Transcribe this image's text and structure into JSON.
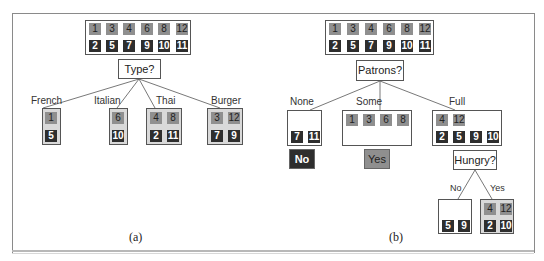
{
  "panel_a": {
    "caption": "(a)",
    "root": {
      "positive": [
        "1",
        "3",
        "4",
        "6",
        "8",
        "12"
      ],
      "negative": [
        "2",
        "5",
        "7",
        "9",
        "10",
        "11"
      ]
    },
    "question": "Type?",
    "branches": [
      {
        "label": "French",
        "positive": [
          "1"
        ],
        "negative": [
          "5"
        ]
      },
      {
        "label": "Italian",
        "positive": [
          "6"
        ],
        "negative": [
          "10"
        ]
      },
      {
        "label": "Thai",
        "positive": [
          "4",
          "8"
        ],
        "negative": [
          "2",
          "11"
        ]
      },
      {
        "label": "Burger",
        "positive": [
          "3",
          "12"
        ],
        "negative": [
          "7",
          "9"
        ]
      }
    ]
  },
  "panel_b": {
    "caption": "(b)",
    "root": {
      "positive": [
        "1",
        "3",
        "4",
        "6",
        "8",
        "12"
      ],
      "negative": [
        "2",
        "5",
        "7",
        "9",
        "10",
        "11"
      ]
    },
    "question": "Patrons?",
    "branches": [
      {
        "label": "None",
        "positive": [],
        "negative": [
          "7",
          "11"
        ],
        "leaf": "No"
      },
      {
        "label": "Some",
        "positive": [
          "1",
          "3",
          "6",
          "8"
        ],
        "negative": [],
        "leaf": "Yes"
      },
      {
        "label": "Full",
        "positive": [
          "4",
          "12"
        ],
        "negative": [
          "2",
          "5",
          "9",
          "10"
        ]
      }
    ],
    "sub_question": "Hungry?",
    "sub_branches": [
      {
        "label": "No",
        "positive": [],
        "negative": [
          "5",
          "9"
        ]
      },
      {
        "label": "Yes",
        "positive": [
          "4",
          "12"
        ],
        "negative": [
          "2",
          "10"
        ]
      }
    ]
  },
  "colors": {
    "positive": "#8f8f8f",
    "negative": "#2e2e2e",
    "frame": "#8a8a8a"
  }
}
